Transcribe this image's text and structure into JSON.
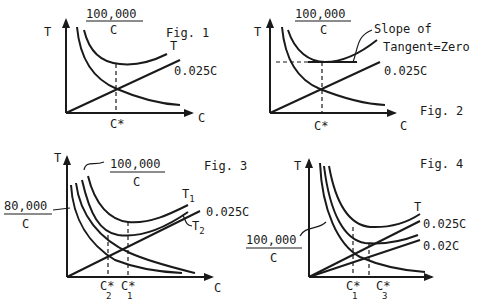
{
  "figures": [
    {
      "label": "Fig. 1",
      "y_axis": "T",
      "x_axis": "C",
      "fraction": {
        "num": "100,000",
        "den": "C"
      },
      "curves": [
        "T",
        "0.025C"
      ],
      "x_marker": "C*"
    },
    {
      "label": "Fig. 2",
      "y_axis": "T",
      "x_axis": "C",
      "fraction": {
        "num": "100,000",
        "den": "C"
      },
      "annotation_line1": "Slope of",
      "annotation_line2": "Tangent=Zero",
      "curves": [
        "0.025C"
      ],
      "x_marker": "C*"
    },
    {
      "label": "Fig. 3",
      "y_axis": "T",
      "x_axis": "C",
      "fraction": {
        "num": "100,000",
        "den": "C"
      },
      "fraction2": {
        "num": "80,000",
        "den": "C"
      },
      "curves": [
        "T",
        "0.025C",
        "T"
      ],
      "curve_subs": [
        "1",
        "",
        "2"
      ],
      "x_markers": [
        {
          "main": "C*",
          "sub": "2"
        },
        {
          "main": "C*",
          "sub": "1"
        }
      ]
    },
    {
      "label": "Fig. 4",
      "y_axis": "T",
      "x_axis": "",
      "fraction": {
        "num": "100,000",
        "den": "C"
      },
      "curves": [
        "T",
        "0.025C",
        "0.02C"
      ],
      "x_markers": [
        {
          "main": "C*",
          "sub": "1"
        },
        {
          "main": "C*",
          "sub": "3"
        }
      ]
    }
  ]
}
